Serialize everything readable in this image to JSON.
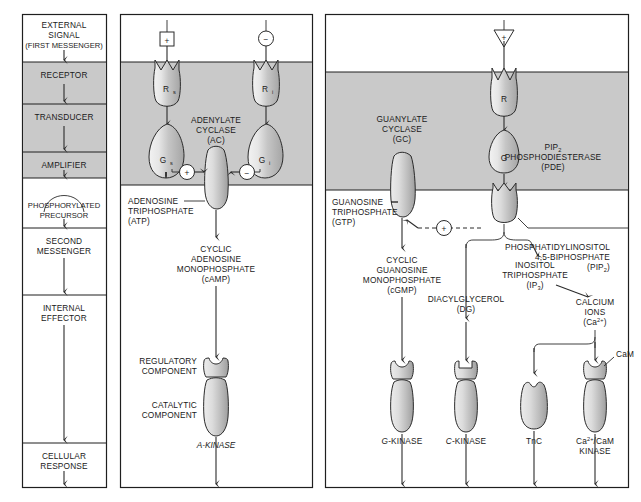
{
  "figure": {
    "colors": {
      "membrane": "#c9c9c9",
      "protein_light": "#e3e3e3",
      "protein_mid": "#c4c4c4",
      "protein_dark": "#9a9a9a",
      "stroke": "#2b2b2b",
      "background": "#ffffff"
    }
  },
  "left_panel": {
    "name": "generic-signalling-stages",
    "stages": [
      {
        "id": "external-signal",
        "line1": "EXTERNAL",
        "line2": "SIGNAL",
        "line3": "(FIRST MESSENGER)",
        "shaded": false
      },
      {
        "id": "receptor",
        "line1": "RECEPTOR",
        "shaded": true
      },
      {
        "id": "transducer",
        "line1": "TRANSDUCER",
        "shaded": true
      },
      {
        "id": "amplifier",
        "line1": "AMPLIFIER",
        "shaded": true
      },
      {
        "id": "phosphorylated-precursor",
        "line1": "PHOSPHORYLATED",
        "line2": "PRECURSOR",
        "shaded": false
      },
      {
        "id": "second-messenger",
        "line1": "SECOND",
        "line2": "MESSENGER",
        "shaded": false
      },
      {
        "id": "internal-effector",
        "line1": "INTERNAL",
        "line2": "EFFECTOR",
        "shaded": false
      },
      {
        "id": "cellular-response",
        "line1": "CELLULAR",
        "line2": "RESPONSE",
        "shaded": false
      }
    ]
  },
  "middle_panel": {
    "name": "adenylate-cyclase-pathway",
    "stimulatory_sign": "+",
    "inhibitory_sign": "−",
    "receptor_stimulatory": {
      "label": "R",
      "sub": "s"
    },
    "receptor_inhibitory": {
      "label": "R",
      "sub": "i"
    },
    "g_protein_stimulatory": {
      "label": "G",
      "sub": "s"
    },
    "g_protein_inhibitory": {
      "label": "G",
      "sub": "i"
    },
    "enzyme": {
      "line1": "ADENYLATE",
      "line2": "CYCLASE",
      "line3": "(AC)"
    },
    "substrate": {
      "line1": "ADENOSINE",
      "line2": "TRIPHOSPHATE",
      "line3": "(ATP)"
    },
    "second_messenger": {
      "line1": "CYCLIC",
      "line2": "ADENOSINE",
      "line3": "MONOPHOSPHATE",
      "line4": "(cAMP)"
    },
    "regulatory_component": {
      "line1": "REGULATORY",
      "line2": "COMPONENT"
    },
    "catalytic_component": {
      "line1": "CATALYTIC",
      "line2": "COMPONENT"
    },
    "kinase": "A-KINASE",
    "plus_modifier": "+",
    "minus_modifier": "−"
  },
  "right_panel": {
    "name": "guanylate-cyclase-and-pip2-pathway",
    "signal_marker": "+",
    "receptor": {
      "label": "R"
    },
    "g_protein": {
      "label": "G"
    },
    "guanylate_cyclase": {
      "line1": "GUANYLATE",
      "line2": "CYCLASE",
      "line3": "(GC)"
    },
    "phosphodiesterase": {
      "line1": "PIP",
      "line1_sub": "2",
      "line2": "PHOSPHODIESTERASE",
      "line3": "(PDE)"
    },
    "gtp": {
      "line1": "GUANOSINE",
      "line2": "TRIPHOSPHATE",
      "line3": "(GTP)"
    },
    "pip2": {
      "line1": "PHOSPHATIDYLINOSITOL",
      "line2": "4,5-BIPHOSPHATE",
      "line3": "(PIP",
      "line3_sub": "2",
      "line3_end": ")"
    },
    "cgmp": {
      "line1": "CYCLIC",
      "line2": "GUANOSINE",
      "line3": "MONOPHOSPHATE",
      "line4": "(cGMP)"
    },
    "activation_sign": "+",
    "ip3": {
      "line1": "INOSITOL",
      "line2": "TRIPHOSPHATE",
      "line3": "(IP",
      "line3_sub": "3",
      "line3_end": ")"
    },
    "dg": {
      "line1": "DIACYLGLYCEROL",
      "line2": "(DG)"
    },
    "calcium": {
      "line1": "CALCIUM",
      "line2": "IONS",
      "line3": "(Ca",
      "line3_sup": "2+",
      "line3_end": ")"
    },
    "cam_label": "CaM",
    "effectors": [
      {
        "id": "g-kinase",
        "label": "G-KINASE",
        "italic_prefix": "G",
        "rest": "-KINASE"
      },
      {
        "id": "c-kinase",
        "label": "C-KINASE",
        "italic_prefix": "C",
        "rest": "-KINASE"
      },
      {
        "id": "tnc",
        "label": "TnC"
      },
      {
        "id": "cam-kinase",
        "line1": "Ca",
        "line1_sup": "2+",
        "line1_mid": "/CaM",
        "line2": "KINASE"
      }
    ]
  }
}
